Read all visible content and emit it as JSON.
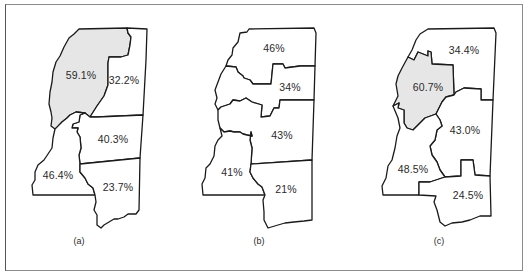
{
  "figure": {
    "panels": [
      {
        "caption": "(a)",
        "regions": [
          {
            "label": "59.1%",
            "shaded": true
          },
          {
            "label": "32.2%",
            "shaded": false
          },
          {
            "label": "40.3%",
            "shaded": false
          },
          {
            "label": "46.4%",
            "shaded": false
          },
          {
            "label": "23.7%",
            "shaded": false
          }
        ]
      },
      {
        "caption": "(b)",
        "regions": [
          {
            "label": "46%",
            "shaded": false
          },
          {
            "label": "34%",
            "shaded": false
          },
          {
            "label": "43%",
            "shaded": false
          },
          {
            "label": "41%",
            "shaded": false
          },
          {
            "label": "21%",
            "shaded": false
          }
        ]
      },
      {
        "caption": "(c)",
        "regions": [
          {
            "label": "34.4%",
            "shaded": false
          },
          {
            "label": "60.7%",
            "shaded": true
          },
          {
            "label": "43.0%",
            "shaded": false
          },
          {
            "label": "48.5%",
            "shaded": false
          },
          {
            "label": "24.5%",
            "shaded": false
          }
        ]
      }
    ],
    "colors": {
      "shaded_fill": "#e6e6e6",
      "outline": "#1a1a1a",
      "frame": "#8a8a8a"
    }
  }
}
